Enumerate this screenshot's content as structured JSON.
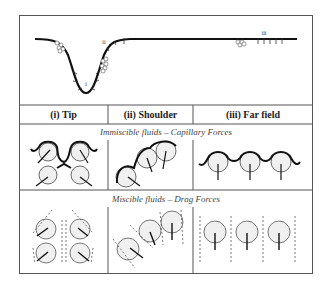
{
  "figure": {
    "top_panel": {
      "labels": {
        "tip": "i",
        "shoulder": "ii",
        "far_field": "iii"
      }
    },
    "columns": [
      {
        "label": "(i) Tip"
      },
      {
        "label": "(ii) Shoulder"
      },
      {
        "label": "(iii) Far field"
      }
    ],
    "rows": [
      {
        "title": "Immiscible fluids – Capillary Forces"
      },
      {
        "title": "Miscible fluids – Drag Forces"
      }
    ],
    "colors": {
      "line": "#111111",
      "grain_fill": "#ececec",
      "grain_stroke": "#555555",
      "border": "#555555"
    }
  }
}
